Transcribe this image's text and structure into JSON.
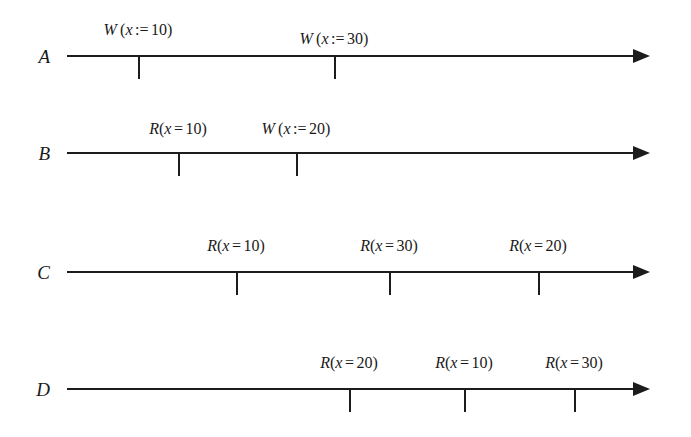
{
  "figure": {
    "background_color": "#ffffff",
    "ink_color": "#1c1c1c"
  },
  "rows": [
    {
      "label": "A",
      "label_x": 50,
      "label_y": 47,
      "axis_y": 55,
      "axis_start_x": 67,
      "axis_end_x": 633,
      "arrow_tip_x": 650,
      "tick_length": 24,
      "events": [
        {
          "op": "W",
          "spaced": true,
          "var": "x",
          "operator": ":=",
          "value": "10",
          "text": "W (x := 10)",
          "tick_x": 138,
          "label_y": 22
        },
        {
          "op": "W",
          "spaced": true,
          "var": "x",
          "operator": ":=",
          "value": "30",
          "text": "W (x := 30)",
          "tick_x": 334,
          "label_y": 31
        }
      ]
    },
    {
      "label": "B",
      "label_x": 50,
      "label_y": 144,
      "axis_y": 152,
      "axis_start_x": 67,
      "axis_end_x": 633,
      "arrow_tip_x": 650,
      "tick_length": 24,
      "events": [
        {
          "op": "R",
          "spaced": false,
          "var": "x",
          "operator": "=",
          "value": "10",
          "text": "R(x = 10)",
          "tick_x": 178,
          "label_y": 121
        },
        {
          "op": "W",
          "spaced": true,
          "var": "x",
          "operator": ":=",
          "value": "20",
          "text": "W (x := 20)",
          "tick_x": 296,
          "label_y": 121
        }
      ]
    },
    {
      "label": "C",
      "label_x": 50,
      "label_y": 263,
      "axis_y": 271,
      "axis_start_x": 67,
      "axis_end_x": 633,
      "arrow_tip_x": 650,
      "tick_length": 24,
      "events": [
        {
          "op": "R",
          "spaced": false,
          "var": "x",
          "operator": "=",
          "value": "10",
          "text": "R(x = 10)",
          "tick_x": 236,
          "label_y": 238
        },
        {
          "op": "R",
          "spaced": false,
          "var": "x",
          "operator": "=",
          "value": "30",
          "text": "R(x = 30)",
          "tick_x": 389,
          "label_y": 238
        },
        {
          "op": "R",
          "spaced": false,
          "var": "x",
          "operator": "=",
          "value": "20",
          "text": "R(x = 20)",
          "tick_x": 538,
          "label_y": 238
        }
      ]
    },
    {
      "label": "D",
      "label_x": 50,
      "label_y": 380,
      "axis_y": 388,
      "axis_start_x": 67,
      "axis_end_x": 633,
      "arrow_tip_x": 650,
      "tick_length": 24,
      "events": [
        {
          "op": "R",
          "spaced": false,
          "var": "x",
          "operator": "=",
          "value": "20",
          "text": "R(x = 20)",
          "tick_x": 349,
          "label_y": 355
        },
        {
          "op": "R",
          "spaced": false,
          "var": "x",
          "operator": "=",
          "value": "10",
          "text": "R(x = 10)",
          "tick_x": 464,
          "label_y": 355
        },
        {
          "op": "R",
          "spaced": false,
          "var": "x",
          "operator": "=",
          "value": "30",
          "text": "R(x = 30)",
          "tick_x": 574,
          "label_y": 355
        }
      ]
    }
  ]
}
